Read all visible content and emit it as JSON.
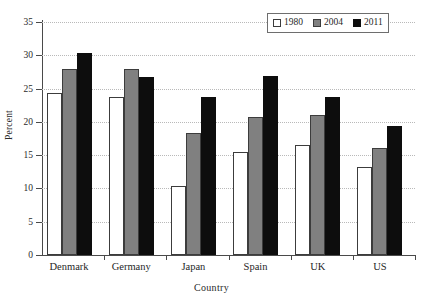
{
  "chart_data": {
    "type": "bar",
    "title": "",
    "xlabel": "Country",
    "ylabel": "Percent",
    "categories": [
      "Denmark",
      "Germany",
      "Japan",
      "Spain",
      "UK",
      "US"
    ],
    "series": [
      {
        "name": "1980",
        "color": "#ffffff",
        "values": [
          24.4,
          23.7,
          10.4,
          15.4,
          16.6,
          13.2
        ]
      },
      {
        "name": "2004",
        "color": "#808080",
        "values": [
          27.9,
          28.0,
          18.3,
          20.7,
          21.0,
          16.1
        ]
      },
      {
        "name": "2011",
        "color": "#0d0d0d",
        "values": [
          30.3,
          26.8,
          23.8,
          26.9,
          23.8,
          19.4
        ]
      }
    ],
    "ylim": [
      0,
      35
    ],
    "ytick_labels": [
      "0",
      "5",
      "10",
      "15",
      "20",
      "25",
      "30",
      "35"
    ],
    "ytick_values": [
      0,
      5,
      10,
      15,
      20,
      25,
      30,
      35
    ],
    "grid": "horizontal-dotted",
    "legend_position": "top-right"
  },
  "legend": {
    "items": [
      {
        "label": "1980",
        "swatch": "white-square-icon"
      },
      {
        "label": "2004",
        "swatch": "gray-square-icon"
      },
      {
        "label": "2011",
        "swatch": "black-square-icon"
      }
    ]
  },
  "axes": {
    "x_title": "Country",
    "y_title": "Percent"
  }
}
